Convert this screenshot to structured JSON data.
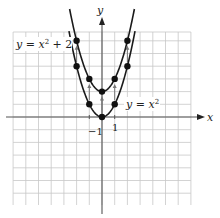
{
  "chart_data": {
    "type": "line",
    "title": "",
    "xlabel": "x",
    "ylabel": "y",
    "xlim": [
      -7,
      7
    ],
    "ylim": [
      -7,
      7
    ],
    "grid": true,
    "tick_labels": {
      "x": [
        "-1",
        "1"
      ]
    },
    "series": [
      {
        "name": "y = x^2",
        "label": "y = x²",
        "points": [
          [
            -2,
            4
          ],
          [
            -1,
            1
          ],
          [
            0,
            0
          ],
          [
            1,
            1
          ],
          [
            2,
            4
          ]
        ]
      },
      {
        "name": "y = x^2 + 2",
        "label": "y = x² + 2",
        "points": [
          [
            -2,
            6
          ],
          [
            -1,
            3
          ],
          [
            0,
            2
          ],
          [
            1,
            3
          ],
          [
            2,
            6
          ]
        ]
      }
    ],
    "annotations": [
      "Vertical arrows indicate upward shift of 2 units from y = x² to y = x² + 2"
    ]
  },
  "labels": {
    "x_axis": "x",
    "y_axis": "y",
    "tick_neg1": "−1",
    "tick_pos1": "1",
    "curve1_prefix": "y = x",
    "curve1_exp": "2",
    "curve2_prefix": "y = x",
    "curve2_exp": "2",
    "curve2_suffix": " + 2"
  },
  "colors": {
    "grid": "#c8c8c8",
    "axis": "#555555",
    "curve": "#1a1a1a",
    "arrow": "#777777"
  }
}
